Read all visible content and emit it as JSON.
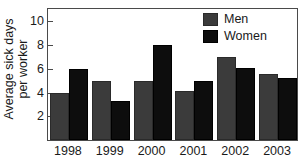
{
  "chart_data": {
    "type": "bar",
    "title": "",
    "xlabel": "",
    "ylabel": "Average sick days per worker",
    "ylabel_lines": [
      "Average sick days",
      "per worker"
    ],
    "categories": [
      "1998",
      "1999",
      "2000",
      "2001",
      "2002",
      "2003"
    ],
    "series": [
      {
        "name": "Men",
        "color": "#3b3b3b",
        "values": [
          4.0,
          5.0,
          5.0,
          4.1,
          7.0,
          5.6
        ]
      },
      {
        "name": "Women",
        "color": "#0d0d0d",
        "values": [
          6.0,
          3.3,
          8.0,
          5.0,
          6.05,
          5.2
        ]
      }
    ],
    "ylim": [
      0,
      11.2
    ],
    "yticks": [
      2,
      4,
      6,
      8,
      10
    ],
    "ytick_labels": [
      "2",
      "4",
      "6",
      "8",
      "10"
    ],
    "grid": false,
    "legend_position": "top-right",
    "legend_entries": [
      "Men",
      "Women"
    ]
  }
}
